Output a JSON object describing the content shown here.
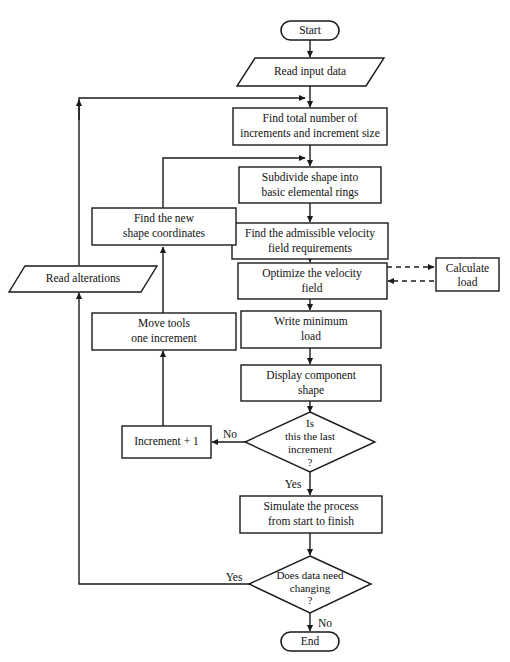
{
  "diagram": {
    "colors": {
      "background": "#ffffff",
      "stroke": "#1a1a1a",
      "text": "#111111",
      "shape_fill": "#ffffff"
    }
  },
  "nodes": {
    "start": {
      "label": "Start",
      "shape": "terminator"
    },
    "read_input": {
      "label": "Read input data",
      "shape": "parallelogram"
    },
    "find_total": {
      "line1": "Find total number of",
      "line2": "increments and increment size",
      "shape": "process"
    },
    "subdivide": {
      "line1": "Subdivide shape into",
      "line2": "basic elemental rings",
      "shape": "process"
    },
    "find_admissible": {
      "line1": "Find the admissible velocity",
      "line2": "field requirements",
      "shape": "process"
    },
    "optimize": {
      "line1": "Optimize the velocity",
      "line2": "field",
      "shape": "process"
    },
    "calculate_load": {
      "line1": "Calculate",
      "line2": "load",
      "shape": "process"
    },
    "write_minimum": {
      "line1": "Write minimum",
      "line2": "load",
      "shape": "process"
    },
    "display_component": {
      "line1": "Display component",
      "line2": "shape",
      "shape": "process"
    },
    "find_new_shape": {
      "line1": "Find the new",
      "line2": "shape coordinates",
      "shape": "process"
    },
    "move_tools": {
      "line1": "Move tools",
      "line2": "one increment",
      "shape": "process"
    },
    "read_alterations": {
      "label": "Read alterations",
      "shape": "parallelogram"
    },
    "increment_plus_one": {
      "label": "Increment + 1",
      "shape": "process"
    },
    "is_last_increment": {
      "line1": "Is",
      "line2": "this the last",
      "line3": "increment",
      "line4": "?",
      "shape": "decision"
    },
    "simulate": {
      "line1": "Simulate the process",
      "line2": "from start to finish",
      "shape": "process"
    },
    "data_need_changing": {
      "line1": "Does data need",
      "line2": "changing",
      "line3": "?",
      "shape": "decision"
    },
    "end": {
      "label": "End",
      "shape": "terminator"
    }
  },
  "edge_labels": {
    "last_increment_no": "No",
    "last_increment_yes": "Yes",
    "data_changing_yes": "Yes",
    "data_changing_no": "No"
  }
}
